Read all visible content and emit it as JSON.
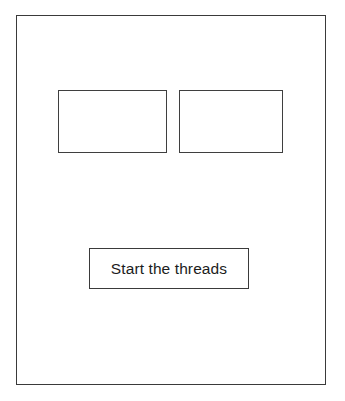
{
  "window": {
    "name": "thread-demo-window",
    "background_color": "#ffffff",
    "border_color": "#3a3a3a"
  },
  "panels": [
    {
      "name": "output-panel-left",
      "label": "",
      "content": "",
      "border_color": "#3f3f3f",
      "background_color": "#ffffff"
    },
    {
      "name": "output-panel-right",
      "label": "",
      "content": "",
      "border_color": "#3f3f3f",
      "background_color": "#ffffff"
    }
  ],
  "button": {
    "name": "start-threads-button",
    "label": "Start the threads",
    "text_color": "#1c1c1c",
    "border_color": "#3a3a3a",
    "background_color": "#ffffff"
  }
}
